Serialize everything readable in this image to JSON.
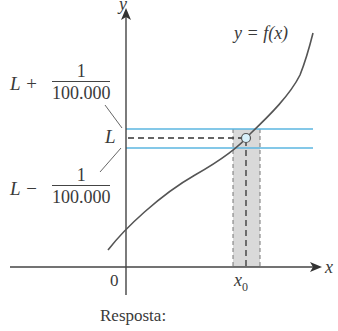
{
  "diagram": {
    "axis_labels": {
      "x": "x",
      "y": "y"
    },
    "origin_label": "0",
    "x0_label": {
      "base": "x",
      "sub": "0"
    },
    "curve_label": "y = f(x)",
    "L_label": "L",
    "upper_label": {
      "prefix": "L +",
      "numerator": "1",
      "denominator": "100.000"
    },
    "lower_label": {
      "prefix": "L −",
      "numerator": "1",
      "denominator": "100.000"
    },
    "caption": "Resposta:",
    "colors": {
      "axis": "#444444",
      "curve": "#555555",
      "band_lines": "#5bb6e0",
      "shade": "#d9d9d9",
      "point_fill": "#d8f1fb"
    }
  }
}
